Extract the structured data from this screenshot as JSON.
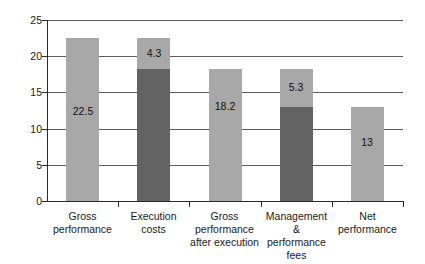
{
  "chart_data": {
    "type": "bar",
    "title": "",
    "subtitle": "",
    "xlabel": "",
    "ylabel": "",
    "ylim": [
      0,
      25
    ],
    "ytick_labels": [
      "0",
      "5",
      "10",
      "15",
      "20",
      "25"
    ],
    "ytick_values": [
      0,
      5,
      10,
      15,
      20,
      25
    ],
    "grid": "horizontal",
    "legend": "none",
    "stacked": true,
    "categories": [
      "Gross performance",
      "Execution costs",
      "Gross performance after execution",
      "Management & performance fees",
      "Net performance"
    ],
    "category_lines": [
      [
        "Gross",
        "performance"
      ],
      [
        "Execution costs"
      ],
      [
        "Gross",
        "performance",
        "after execution"
      ],
      [
        "Management &",
        "performance",
        "fees"
      ],
      [
        "Net",
        "performance"
      ]
    ],
    "values": [
      22.5,
      22.5,
      18.2,
      18.2,
      13
    ],
    "bars": [
      {
        "category": "Gross performance",
        "total": 22.5,
        "label": "22.5",
        "label_value": 22.5,
        "segments": [
          {
            "from": 0,
            "to": 22.5,
            "color_key": "light"
          }
        ]
      },
      {
        "category": "Execution costs",
        "total": 22.5,
        "label": "4.3",
        "label_value": 4.3,
        "segments": [
          {
            "from": 0,
            "to": 18.2,
            "color_key": "dark"
          },
          {
            "from": 18.2,
            "to": 22.5,
            "color_key": "light"
          }
        ]
      },
      {
        "category": "Gross performance after execution",
        "total": 18.2,
        "label": "18.2",
        "label_value": 18.2,
        "segments": [
          {
            "from": 0,
            "to": 18.2,
            "color_key": "light"
          }
        ]
      },
      {
        "category": "Management & performance fees",
        "total": 18.2,
        "label": "5.3",
        "label_value": 5.3,
        "segments": [
          {
            "from": 0,
            "to": 13,
            "color_key": "dark"
          },
          {
            "from": 13,
            "to": 18.2,
            "color_key": "light"
          }
        ]
      },
      {
        "category": "Net performance",
        "total": 13,
        "label": "13",
        "label_value": 13,
        "segments": [
          {
            "from": 0,
            "to": 13,
            "color_key": "light"
          }
        ]
      }
    ],
    "colors": {
      "bar_light": "#a8a8a8",
      "bar_dark": "#636363",
      "axis": "#2a2a2a",
      "gridline": "#5c5c5c",
      "background": "#ffffff",
      "text": "#1a1a1a"
    }
  }
}
